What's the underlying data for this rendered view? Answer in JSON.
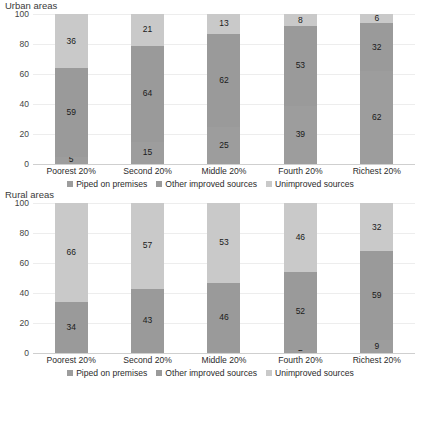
{
  "legend": {
    "items": [
      {
        "label": "Piped on premises",
        "color": "#9d9d9d"
      },
      {
        "label": "Other improved sources",
        "color": "#9a9a9a"
      },
      {
        "label": "Unimproved sources",
        "color": "#c9c9c9"
      }
    ]
  },
  "panels": [
    {
      "title": "Urban areas",
      "yticks": [
        "100",
        "80",
        "60",
        "40",
        "20",
        "0"
      ]
    },
    {
      "title": "Rural areas",
      "yticks": [
        "100",
        "80",
        "60",
        "40",
        "20",
        "0"
      ]
    }
  ],
  "chart_data": [
    {
      "type": "bar",
      "title": "Urban areas",
      "stacked": true,
      "xlabel": "",
      "ylabel": "",
      "ylim": [
        0,
        100
      ],
      "yticks": [
        0,
        20,
        40,
        60,
        80,
        100
      ],
      "grid": true,
      "legend_position": "bottom",
      "categories": [
        "Poorest 20%",
        "Second 20%",
        "Middle 20%",
        "Fourth 20%",
        "Richest 20%"
      ],
      "series": [
        {
          "name": "Piped on premises",
          "color": "#9d9d9d",
          "values": [
            5,
            15,
            25,
            39,
            62
          ]
        },
        {
          "name": "Other improved sources",
          "color": "#9a9a9a",
          "values": [
            59,
            64,
            62,
            53,
            32
          ]
        },
        {
          "name": "Unimproved sources",
          "color": "#c9c9c9",
          "values": [
            36,
            21,
            13,
            8,
            6
          ]
        }
      ]
    },
    {
      "type": "bar",
      "title": "Rural areas",
      "stacked": true,
      "xlabel": "",
      "ylabel": "",
      "ylim": [
        0,
        100
      ],
      "yticks": [
        0,
        20,
        40,
        60,
        80,
        100
      ],
      "grid": true,
      "legend_position": "bottom",
      "categories": [
        "Poorest 20%",
        "Second 20%",
        "Middle 20%",
        "Fourth 20%",
        "Richest 20%"
      ],
      "series": [
        {
          "name": "Piped on premises",
          "color": "#9d9d9d",
          "values": [
            0,
            0,
            1,
            2,
            9
          ]
        },
        {
          "name": "Other improved sources",
          "color": "#9a9a9a",
          "values": [
            34,
            43,
            46,
            52,
            59
          ]
        },
        {
          "name": "Unimproved sources",
          "color": "#c9c9c9",
          "values": [
            66,
            57,
            53,
            46,
            32
          ]
        }
      ]
    }
  ]
}
